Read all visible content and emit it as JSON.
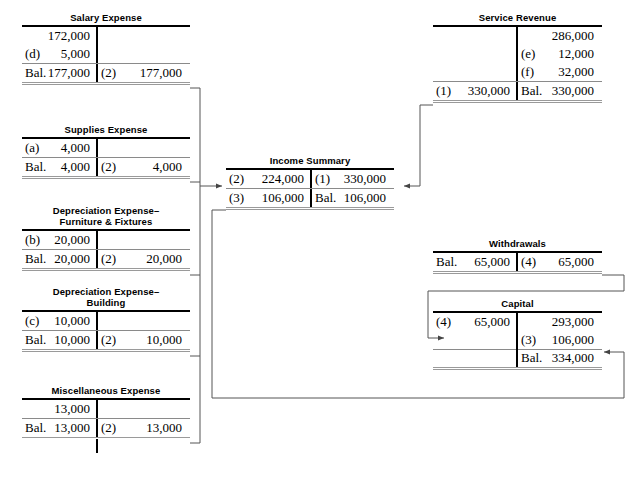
{
  "diagram": {
    "accounts": [
      {
        "id": "salary-expense",
        "name": "Salary Expense",
        "rows": [
          {
            "left_ref": "",
            "left_amt": "172,000",
            "right_ref": "",
            "right_amt": ""
          },
          {
            "left_ref": "(d)",
            "left_amt": "5,000",
            "right_ref": "",
            "right_amt": ""
          }
        ],
        "balance_row": {
          "left_ref": "Bal.",
          "left_amt": "177,000",
          "right_ref": "(2)",
          "right_amt": "177,000"
        }
      },
      {
        "id": "supplies-expense",
        "name": "Supplies Expense",
        "rows": [
          {
            "left_ref": "(a)",
            "left_amt": "4,000",
            "right_ref": "",
            "right_amt": ""
          }
        ],
        "balance_row": {
          "left_ref": "Bal.",
          "left_amt": "4,000",
          "right_ref": "(2)",
          "right_amt": "4,000"
        }
      },
      {
        "id": "depreciation-expense-furniture-fixtures",
        "name": "Depreciation Expense–\nFurniture & Fixtures",
        "rows": [
          {
            "left_ref": "(b)",
            "left_amt": "20,000",
            "right_ref": "",
            "right_amt": ""
          }
        ],
        "balance_row": {
          "left_ref": "Bal.",
          "left_amt": "20,000",
          "right_ref": "(2)",
          "right_amt": "20,000"
        }
      },
      {
        "id": "depreciation-expense-building",
        "name": "Depreciation Expense–\nBuilding",
        "rows": [
          {
            "left_ref": "(c)",
            "left_amt": "10,000",
            "right_ref": "",
            "right_amt": ""
          }
        ],
        "balance_row": {
          "left_ref": "Bal.",
          "left_amt": "10,000",
          "right_ref": "(2)",
          "right_amt": "10,000"
        }
      },
      {
        "id": "miscellaneous-expense",
        "name": "Miscellaneous Expense",
        "rows": [
          {
            "left_ref": "",
            "left_amt": "13,000",
            "right_ref": "",
            "right_amt": ""
          }
        ],
        "balance_row": {
          "left_ref": "Bal.",
          "left_amt": "13,000",
          "right_ref": "(2)",
          "right_amt": "13,000"
        }
      },
      {
        "id": "income-summary",
        "name": "Income Summary",
        "rows": [
          {
            "left_ref": "(2)",
            "left_amt": "224,000",
            "right_ref": "(1)",
            "right_amt": "330,000"
          }
        ],
        "balance_row": {
          "left_ref": "(3)",
          "left_amt": "106,000",
          "right_ref": "Bal.",
          "right_amt": "106,000"
        }
      },
      {
        "id": "service-revenue",
        "name": "Service Revenue",
        "rows": [
          {
            "left_ref": "",
            "left_amt": "",
            "right_ref": "",
            "right_amt": "286,000"
          },
          {
            "left_ref": "",
            "left_amt": "",
            "right_ref": "(e)",
            "right_amt": "12,000"
          },
          {
            "left_ref": "",
            "left_amt": "",
            "right_ref": "(f)",
            "right_amt": "32,000"
          }
        ],
        "balance_row": {
          "left_ref": "(1)",
          "left_amt": "330,000",
          "right_ref": "Bal.",
          "right_amt": "330,000"
        }
      },
      {
        "id": "withdrawals",
        "name": "Withdrawals",
        "rows": [],
        "balance_row": {
          "left_ref": "Bal.",
          "left_amt": "65,000",
          "right_ref": "(4)",
          "right_amt": "65,000"
        }
      },
      {
        "id": "capital",
        "name": "Capital",
        "rows": [
          {
            "left_ref": "(4)",
            "left_amt": "65,000",
            "right_ref": "",
            "right_amt": "293,000"
          },
          {
            "left_ref": "",
            "left_amt": "",
            "right_ref": "(3)",
            "right_amt": "106,000"
          }
        ],
        "balance_row": {
          "left_ref": "",
          "left_amt": "",
          "right_ref": "Bal.",
          "right_amt": "334,000"
        }
      }
    ],
    "connectors": [
      {
        "id": "expenses-to-income-summary",
        "label": "(2)"
      },
      {
        "id": "service-revenue-to-income-summary",
        "label": "(1)"
      },
      {
        "id": "income-summary-to-capital",
        "label": "(3)"
      },
      {
        "id": "withdrawals-to-capital",
        "label": "(4)"
      }
    ],
    "colors": {
      "rule": "#000000",
      "light_rule": "#8a8a8a",
      "wire": "#555555",
      "background": "#ffffff"
    }
  }
}
